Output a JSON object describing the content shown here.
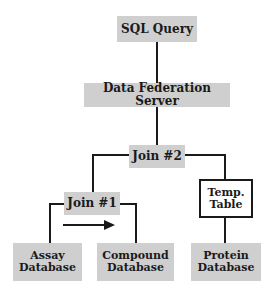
{
  "diagram": {
    "nodes": {
      "sql_query": "SQL Query",
      "data_federation_server": "Data Federation Server",
      "join2": "Join #2",
      "join1": "Join #1",
      "temp_table": "Temp.\nTable",
      "temp_table_line1": "Temp.",
      "temp_table_line2": "Table",
      "assay_db_line1": "Assay",
      "assay_db_line2": "Database",
      "compound_db_line1": "Compound",
      "compound_db_line2": "Database",
      "protein_db_line1": "Protein",
      "protein_db_line2": "Database"
    },
    "edges": [
      [
        "SQL Query",
        "Data Federation Server"
      ],
      [
        "Data Federation Server",
        "Join #2"
      ],
      [
        "Join #2",
        "Join #1"
      ],
      [
        "Join #2",
        "Temp. Table"
      ],
      [
        "Join #1",
        "Assay Database"
      ],
      [
        "Join #1",
        "Compound Database"
      ],
      [
        "Temp. Table",
        "Protein Database"
      ]
    ],
    "arrow": {
      "from": "Assay Database",
      "to": "Compound Database",
      "direction": "right"
    },
    "colors": {
      "box_fill": "#cfcfcf",
      "line": "#1a1a1a",
      "background": "#ffffff"
    }
  }
}
